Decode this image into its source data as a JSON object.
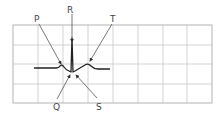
{
  "diagram": {
    "labels": {
      "p": "P",
      "q": "Q",
      "r": "R",
      "s": "S",
      "t": "T"
    },
    "grid": {
      "columns": 8,
      "rows": 4,
      "line_color": "#c8c8c8",
      "border_color": "#b4b4b4"
    },
    "trace_color": "#222222",
    "arrow_color": "#555555"
  }
}
